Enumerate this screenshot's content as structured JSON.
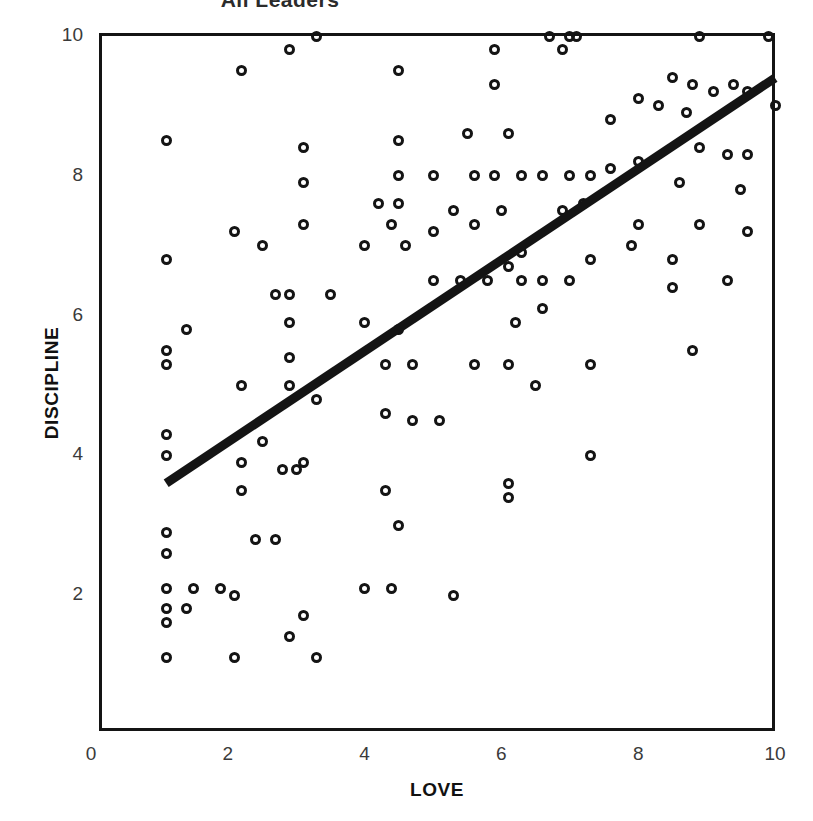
{
  "figure": {
    "title": "All Leaders",
    "background_color": "#ffffff",
    "ink_color": "#141414"
  },
  "axes": {
    "x_title": "LOVE",
    "y_title": "DISCIPLINE",
    "x_ticks": [
      "0",
      "2",
      "4",
      "6",
      "8",
      "10"
    ],
    "y_ticks": [
      "2",
      "4",
      "6",
      "8",
      "10"
    ]
  },
  "chart_data": {
    "type": "scatter",
    "title": "All Leaders",
    "xlabel": "LOVE",
    "ylabel": "DISCIPLINE",
    "xlim": [
      0,
      10
    ],
    "ylim": [
      0,
      10
    ],
    "xticks": [
      0,
      2,
      4,
      6,
      8,
      10
    ],
    "yticks": [
      2,
      4,
      6,
      8,
      10
    ],
    "grid": false,
    "legend": "none",
    "marker": "open-circle",
    "marker_color": "#141414",
    "trendline": {
      "type": "linear-fit",
      "color": "#141414",
      "width_px": 9,
      "x_start": 1.1,
      "y_start": 3.6,
      "x_end": 10.0,
      "y_end": 9.4,
      "slope": 0.65,
      "intercept": 2.88
    },
    "points": [
      [
        3.3,
        10.0
      ],
      [
        6.7,
        10.0
      ],
      [
        7.0,
        10.0
      ],
      [
        7.1,
        10.0
      ],
      [
        8.9,
        10.0
      ],
      [
        9.9,
        10.0
      ],
      [
        2.9,
        9.8
      ],
      [
        5.9,
        9.8
      ],
      [
        6.9,
        9.8
      ],
      [
        2.2,
        9.5
      ],
      [
        4.5,
        9.5
      ],
      [
        8.5,
        9.4
      ],
      [
        9.4,
        9.3
      ],
      [
        9.6,
        9.2
      ],
      [
        9.1,
        9.2
      ],
      [
        8.8,
        9.3
      ],
      [
        10.0,
        9.0
      ],
      [
        5.9,
        9.3
      ],
      [
        8.0,
        9.1
      ],
      [
        8.3,
        9.0
      ],
      [
        7.6,
        8.8
      ],
      [
        8.7,
        8.9
      ],
      [
        1.1,
        8.5
      ],
      [
        3.1,
        8.4
      ],
      [
        4.5,
        8.5
      ],
      [
        5.5,
        8.6
      ],
      [
        6.1,
        8.6
      ],
      [
        8.9,
        8.4
      ],
      [
        9.3,
        8.3
      ],
      [
        9.6,
        8.3
      ],
      [
        8.0,
        8.2
      ],
      [
        3.1,
        7.9
      ],
      [
        4.5,
        8.0
      ],
      [
        5.0,
        8.0
      ],
      [
        5.6,
        8.0
      ],
      [
        5.9,
        8.0
      ],
      [
        6.3,
        8.0
      ],
      [
        6.6,
        8.0
      ],
      [
        7.0,
        8.0
      ],
      [
        7.3,
        8.0
      ],
      [
        7.6,
        8.1
      ],
      [
        8.6,
        7.9
      ],
      [
        9.5,
        7.8
      ],
      [
        4.2,
        7.6
      ],
      [
        4.5,
        7.6
      ],
      [
        5.3,
        7.5
      ],
      [
        6.0,
        7.5
      ],
      [
        6.9,
        7.5
      ],
      [
        7.2,
        7.6
      ],
      [
        3.1,
        7.3
      ],
      [
        4.4,
        7.3
      ],
      [
        5.0,
        7.2
      ],
      [
        5.6,
        7.3
      ],
      [
        8.0,
        7.3
      ],
      [
        8.9,
        7.3
      ],
      [
        9.6,
        7.2
      ],
      [
        2.1,
        7.2
      ],
      [
        2.5,
        7.0
      ],
      [
        4.0,
        7.0
      ],
      [
        4.6,
        7.0
      ],
      [
        6.3,
        6.9
      ],
      [
        7.9,
        7.0
      ],
      [
        1.1,
        6.8
      ],
      [
        6.1,
        6.7
      ],
      [
        7.3,
        6.8
      ],
      [
        8.5,
        6.8
      ],
      [
        2.7,
        6.3
      ],
      [
        2.9,
        6.3
      ],
      [
        3.5,
        6.3
      ],
      [
        5.0,
        6.5
      ],
      [
        5.4,
        6.5
      ],
      [
        5.8,
        6.5
      ],
      [
        6.3,
        6.5
      ],
      [
        6.6,
        6.5
      ],
      [
        7.0,
        6.5
      ],
      [
        8.5,
        6.4
      ],
      [
        9.3,
        6.5
      ],
      [
        1.4,
        5.8
      ],
      [
        2.9,
        5.9
      ],
      [
        4.0,
        5.9
      ],
      [
        4.5,
        5.8
      ],
      [
        6.2,
        5.9
      ],
      [
        6.6,
        6.1
      ],
      [
        1.1,
        5.5
      ],
      [
        1.1,
        5.3
      ],
      [
        2.9,
        5.4
      ],
      [
        4.3,
        5.3
      ],
      [
        4.7,
        5.3
      ],
      [
        5.6,
        5.3
      ],
      [
        6.1,
        5.3
      ],
      [
        7.3,
        5.3
      ],
      [
        8.8,
        5.5
      ],
      [
        2.2,
        5.0
      ],
      [
        2.9,
        5.0
      ],
      [
        6.5,
        5.0
      ],
      [
        3.3,
        4.8
      ],
      [
        4.3,
        4.6
      ],
      [
        4.7,
        4.5
      ],
      [
        5.1,
        4.5
      ],
      [
        1.1,
        4.3
      ],
      [
        1.1,
        4.0
      ],
      [
        2.5,
        4.2
      ],
      [
        7.3,
        4.0
      ],
      [
        2.2,
        3.9
      ],
      [
        2.8,
        3.8
      ],
      [
        3.0,
        3.8
      ],
      [
        3.1,
        3.9
      ],
      [
        2.2,
        3.5
      ],
      [
        4.3,
        3.5
      ],
      [
        6.1,
        3.6
      ],
      [
        6.1,
        3.4
      ],
      [
        4.5,
        3.0
      ],
      [
        1.1,
        2.9
      ],
      [
        1.1,
        2.6
      ],
      [
        2.4,
        2.8
      ],
      [
        2.7,
        2.8
      ],
      [
        1.1,
        2.1
      ],
      [
        1.5,
        2.1
      ],
      [
        1.9,
        2.1
      ],
      [
        2.1,
        2.0
      ],
      [
        4.0,
        2.1
      ],
      [
        4.4,
        2.1
      ],
      [
        5.3,
        2.0
      ],
      [
        1.1,
        1.8
      ],
      [
        1.4,
        1.8
      ],
      [
        3.1,
        1.7
      ],
      [
        1.1,
        1.6
      ],
      [
        2.9,
        1.4
      ],
      [
        1.1,
        1.1
      ],
      [
        2.1,
        1.1
      ],
      [
        3.3,
        1.1
      ]
    ],
    "n_points": 131
  }
}
